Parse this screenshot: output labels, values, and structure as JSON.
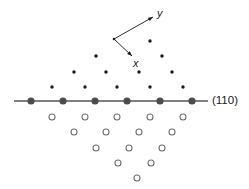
{
  "figure": {
    "title": "",
    "plane_label": "(110)",
    "axes": {
      "x_label": "x",
      "y_label": "y",
      "origin": [
        114,
        39
      ],
      "x_tip": [
        132,
        56
      ],
      "y_tip": [
        153,
        17
      ]
    },
    "surface_line": {
      "color": "#555555",
      "y": 101,
      "x_start": 14,
      "x_end": 208
    },
    "colors": {
      "filled_atom": "#4d4d4d",
      "open_atom_stroke": "#707070",
      "line": "#555555",
      "text": "#1a1a1a"
    }
  },
  "chart_data": {
    "type": "scatter",
    "title": "",
    "xlabel": "",
    "ylabel": "",
    "annotations": [
      "(110)",
      "x",
      "y"
    ],
    "legend": [
      {
        "name": "surface-layer atom",
        "marker": "filled-large",
        "color": "#4d4d4d"
      },
      {
        "name": "upper-layer atom",
        "marker": "filled-small",
        "color": "#1a1a1a"
      },
      {
        "name": "sub-surface atom",
        "marker": "open-circle",
        "color": "#707070"
      }
    ],
    "series": [
      {
        "name": "surface-row-filled",
        "marker": "filled-large",
        "radius": 3.6,
        "points": [
          [
            31,
            101
          ],
          [
            63,
            101
          ],
          [
            95,
            101
          ],
          [
            127,
            101
          ],
          [
            160,
            101
          ],
          [
            192,
            101
          ]
        ]
      },
      {
        "name": "upper-small-dots",
        "marker": "filled-small",
        "radius": 1.7,
        "points": [
          [
            52,
            87
          ],
          [
            85,
            87
          ],
          [
            117,
            87
          ],
          [
            150,
            87
          ],
          [
            183,
            87
          ],
          [
            74,
            72
          ],
          [
            106,
            72
          ],
          [
            139,
            72
          ],
          [
            172,
            72
          ],
          [
            96,
            56
          ],
          [
            162,
            56
          ],
          [
            150,
            41
          ]
        ]
      },
      {
        "name": "lower-open-circles",
        "marker": "open-circle",
        "radius": 3.0,
        "points": [
          [
            52,
            117
          ],
          [
            85,
            117
          ],
          [
            117,
            117
          ],
          [
            150,
            117
          ],
          [
            183,
            117
          ],
          [
            74,
            132
          ],
          [
            106,
            132
          ],
          [
            139,
            132
          ],
          [
            172,
            132
          ],
          [
            96,
            148
          ],
          [
            129,
            148
          ],
          [
            162,
            148
          ],
          [
            118,
            163
          ],
          [
            151,
            163
          ],
          [
            137,
            178
          ]
        ]
      }
    ]
  }
}
